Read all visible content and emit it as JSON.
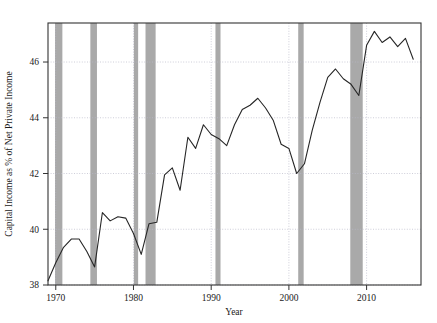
{
  "chart_data": {
    "type": "line",
    "title": "",
    "xlabel": "Year",
    "ylabel": "Capital Income as % of Net Private Income",
    "xlim": [
      1969,
      2017
    ],
    "ylim": [
      38,
      47.4
    ],
    "xticks": [
      1970,
      1980,
      1990,
      2000,
      2010
    ],
    "xtick_labels": [
      "1970",
      "1980",
      "1990",
      "2000",
      "2010"
    ],
    "yticks": [
      38,
      40,
      42,
      44,
      46
    ],
    "ytick_labels": [
      "38",
      "40",
      "42",
      "44",
      "46"
    ],
    "grid": true,
    "legend": "none",
    "line_color": "#262626",
    "band_color": "#a9a9a9",
    "grid_color": "#b9b9c9",
    "frame_color": "#333333",
    "background": "#ffffff",
    "x": [
      1969,
      1970,
      1971,
      1972,
      1973,
      1974,
      1975,
      1976,
      1977,
      1978,
      1979,
      1980,
      1981,
      1982,
      1983,
      1984,
      1985,
      1986,
      1987,
      1988,
      1989,
      1990,
      1991,
      1992,
      1993,
      1994,
      1995,
      1996,
      1997,
      1998,
      1999,
      2000,
      2001,
      2002,
      2003,
      2004,
      2005,
      2006,
      2007,
      2008,
      2009,
      2010,
      2011,
      2012,
      2013,
      2014,
      2015,
      2016
    ],
    "values": [
      38.15,
      38.8,
      39.35,
      39.65,
      39.65,
      39.2,
      38.65,
      40.6,
      40.3,
      40.45,
      40.4,
      39.85,
      39.1,
      40.2,
      40.25,
      41.95,
      42.2,
      41.4,
      43.3,
      42.9,
      43.75,
      43.4,
      43.25,
      43.0,
      43.75,
      44.3,
      44.45,
      44.7,
      44.35,
      43.9,
      43.05,
      42.9,
      42.0,
      42.35,
      43.55,
      44.55,
      45.45,
      45.75,
      45.4,
      45.2,
      44.8,
      46.6,
      47.1,
      46.7,
      46.9,
      46.55,
      46.85,
      46.1
    ],
    "series_name": "Capital Income Share",
    "recession_bands": [
      {
        "start": 1969.9,
        "end": 1970.85
      },
      {
        "start": 1974.45,
        "end": 1975.3
      },
      {
        "start": 1980.05,
        "end": 1980.6
      },
      {
        "start": 1981.55,
        "end": 1982.85
      },
      {
        "start": 1990.55,
        "end": 1991.2
      },
      {
        "start": 2001.2,
        "end": 2001.9
      },
      {
        "start": 2007.9,
        "end": 2009.5
      }
    ]
  },
  "axes": {
    "y_title": "Capital Income as % of Net Private Income",
    "x_title": "Year"
  }
}
